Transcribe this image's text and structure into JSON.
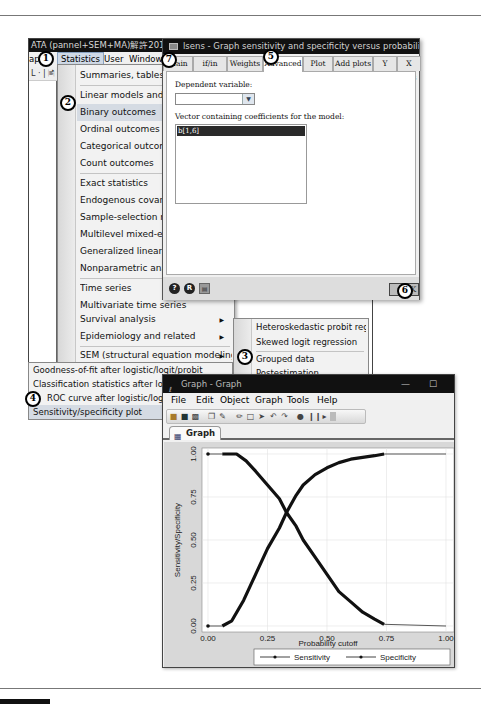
{
  "stata": {
    "title": "ATA (pannel+SEM+MA)解許2014\\07_",
    "menubar": [
      "ap",
      "Statistics",
      "User",
      "Window"
    ],
    "toolbar_fragment": "L · | 🖹"
  },
  "statistics_menu": {
    "items": [
      {
        "label": "Summaries, tables, and",
        "submenu": false
      },
      {
        "label": "Linear models and relat",
        "submenu": false
      },
      {
        "label": "Binary outcomes",
        "submenu": false,
        "highlighted": true
      },
      {
        "label": "Ordinal outcomes",
        "submenu": false
      },
      {
        "label": "Categorical outcomes",
        "submenu": false
      },
      {
        "label": "Count outcomes",
        "submenu": false
      },
      {
        "label": "Exact statistics",
        "submenu": false
      },
      {
        "label": "Endogenous covariates",
        "submenu": false
      },
      {
        "label": "Sample-selection mode",
        "submenu": false
      },
      {
        "label": "Multilevel mixed-effect",
        "submenu": false
      },
      {
        "label": "Generalized linear moc",
        "submenu": false
      },
      {
        "label": "Nonparametric analysis",
        "submenu": false
      },
      {
        "label": "Time series",
        "submenu": false
      },
      {
        "label": "Multivariate time series",
        "submenu": false
      },
      {
        "label": "State-space models",
        "submenu": false
      },
      {
        "label": "Longitudinal/panel dat",
        "submenu": false
      },
      {
        "label": "Survival analysis",
        "submenu": true
      },
      {
        "label": "Epidemiology and related",
        "submenu": true
      },
      {
        "label": "SEM (structural equation modeling)",
        "submenu": true
      }
    ]
  },
  "binary_submenu": {
    "items": [
      {
        "label": "Heteroskedastic probit regressi"
      },
      {
        "label": "Skewed logit regression"
      },
      {
        "label": "Grouped data"
      },
      {
        "label": "Postestimation"
      }
    ]
  },
  "postestimation_submenu": {
    "items": [
      {
        "label": "Goodness-of-fit after logistic/logit/probit"
      },
      {
        "label": "Classification statistics after logistic/l"
      },
      {
        "label": "ROC curve after logistic/logit/probit"
      },
      {
        "label": "Sensitivity/specificity plot",
        "highlighted": true
      }
    ]
  },
  "dialog": {
    "title": "lsens - Graph sensitivity and specificity versus probability cutoff",
    "tabs": [
      "Main",
      "if/in",
      "Weights",
      "Advanced",
      "Plot",
      "Add plots",
      "Y axis",
      "X axis"
    ],
    "active_tab": "Advanced",
    "dependent_variable_label": "Dependent variable:",
    "dependent_variable_value": "",
    "vector_label": "Vector containing coefficients for the model:",
    "vector_value": "b[1,6]",
    "footer_icons": [
      "?",
      "R",
      "copy"
    ],
    "ok_label": "OK"
  },
  "callouts": [
    "1",
    "2",
    "3",
    "4",
    "5",
    "6",
    "7"
  ],
  "graph_window": {
    "title": "Graph - Graph",
    "minimize": "—",
    "maximize": "☐",
    "menubar": [
      "File",
      "Edit",
      "Object",
      "Graph",
      "Tools",
      "Help"
    ],
    "tab_label": "Graph"
  },
  "chart_data": {
    "type": "line",
    "title": "",
    "xlabel": "Probability cutoff",
    "ylabel": "Sensitivity/Specificity",
    "xlim": [
      0,
      1
    ],
    "ylim": [
      0,
      1
    ],
    "x_ticks": [
      "0.00",
      "0.25",
      "0.50",
      "0.75",
      "1.00"
    ],
    "y_ticks": [
      "0.00",
      "0.25",
      "0.50",
      "0.75",
      "1.00"
    ],
    "grid": true,
    "legend_position": "bottom",
    "series": [
      {
        "name": "Sensitivity",
        "x": [
          0.0,
          0.06,
          0.12,
          0.16,
          0.2,
          0.25,
          0.3,
          0.33,
          0.37,
          0.4,
          0.45,
          0.5,
          0.55,
          0.6,
          0.65,
          0.7,
          0.74,
          1.0
        ],
        "y": [
          1.0,
          1.0,
          1.0,
          0.96,
          0.9,
          0.82,
          0.74,
          0.66,
          0.58,
          0.5,
          0.4,
          0.3,
          0.2,
          0.14,
          0.08,
          0.04,
          0.01,
          0.0
        ]
      },
      {
        "name": "Specificity",
        "x": [
          0.0,
          0.06,
          0.1,
          0.15,
          0.2,
          0.25,
          0.3,
          0.33,
          0.37,
          0.4,
          0.45,
          0.5,
          0.55,
          0.6,
          0.65,
          0.7,
          0.74,
          1.0
        ],
        "y": [
          0.0,
          0.0,
          0.03,
          0.15,
          0.3,
          0.45,
          0.57,
          0.66,
          0.76,
          0.82,
          0.88,
          0.92,
          0.95,
          0.97,
          0.98,
          0.99,
          1.0,
          1.0
        ]
      }
    ],
    "legend": [
      "Sensitivity",
      "Specificity"
    ]
  }
}
